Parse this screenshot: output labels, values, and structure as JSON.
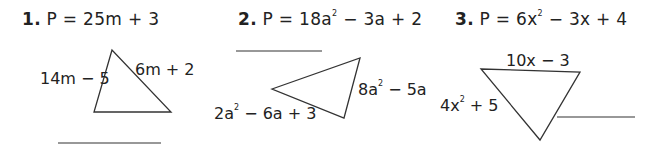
{
  "problems": [
    {
      "number": "1.",
      "formula_prefix": "P = 25m + 3",
      "sides": [
        "14m  − 5",
        "6m + 2"
      ],
      "answer_blank": ""
    },
    {
      "number": "2.",
      "formula": {
        "a": "P = 18a",
        "exp": "2",
        "b": " − 3a + 2"
      },
      "sides": [
        {
          "a": "8a",
          "exp": "2",
          "b": " − 5a"
        },
        {
          "a": "2a",
          "exp": "2",
          "b": " − 6a + 3"
        }
      ],
      "answer_blank": ""
    },
    {
      "number": "3.",
      "formula": {
        "a": "P = 6x",
        "exp": "2",
        "b": " − 3x + 4"
      },
      "sides": [
        "10x − 3",
        {
          "a": "4x",
          "exp": "2",
          "b": "  + 5"
        }
      ],
      "answer_blank": ""
    }
  ]
}
